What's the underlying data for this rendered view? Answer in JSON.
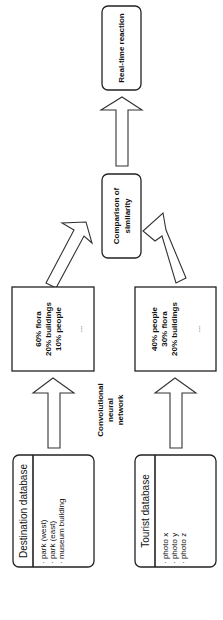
{
  "diagram": {
    "orientation": "rotated-90-counterclockwise",
    "destination_db": {
      "title": "Destination database",
      "items": [
        "· park (west)",
        "· park (east)",
        "· museum building"
      ]
    },
    "tourist_db": {
      "title": "Tourist database",
      "items": [
        "· photo x",
        "· photo y",
        "· photo z"
      ]
    },
    "cnn_label": [
      "Convolutional",
      "neural",
      "network"
    ],
    "destination_result": {
      "lines": [
        "60% flora",
        "20% buildings",
        "10% people"
      ],
      "ellipsis": "..."
    },
    "tourist_result": {
      "lines": [
        "40% people",
        "30% flora",
        "20% buildings"
      ],
      "ellipsis": "..."
    },
    "comparison": {
      "lines": [
        "Comparison of",
        "similarity"
      ]
    },
    "reaction": {
      "label": "Real-time reaction"
    }
  }
}
